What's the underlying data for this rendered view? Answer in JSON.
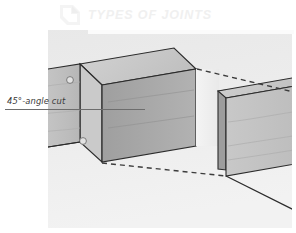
{
  "page": {
    "background_color": "#ffffff",
    "width": 296,
    "height": 233
  },
  "header": {
    "title": "TYPES OF JOINTS",
    "title_color": "#f0f0f0",
    "icon_name": "corner-bracket-icon",
    "band_color": "#fbfbfb"
  },
  "callout": {
    "label": "45°-angle cut",
    "label_color": "#3a3a3a",
    "leader_line_color": "#6d6d6d"
  },
  "illustration": {
    "name": "mitered-butt-joint-diagram",
    "description": "Two boards with 45 degree angled end cuts shown separated, with dashed alignment lines indicating how they meet",
    "colors": {
      "panel_background": "#ededed",
      "board_top_face": "#c9c9c9",
      "board_front_face": "#bdbdbd",
      "board_end_face": "#a8a8a8",
      "board_right_front": "#c4c4c4",
      "outline": "#2a2a2a",
      "dashed_line": "#3c3c3c",
      "grain_line": "#ababab",
      "hole_fill": "#e2e2e2"
    },
    "markers": [
      {
        "name": "dowel-hole-upper",
        "cx": 70,
        "cy": 56,
        "r": 3.4
      },
      {
        "name": "dowel-hole-lower",
        "cx": 83,
        "cy": 117,
        "r": 3.4
      }
    ]
  }
}
